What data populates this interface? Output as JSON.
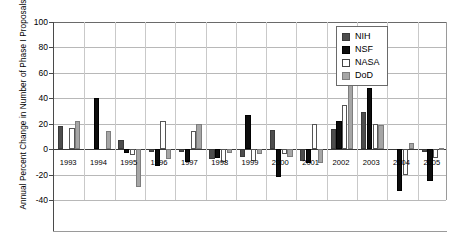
{
  "chart_data": {
    "type": "bar",
    "title": "",
    "ylabel": "Annual Percent Change in Number of Phase I Proposals",
    "xlabel": "",
    "ylim": [
      -40,
      100
    ],
    "yticks": [
      -40,
      -20,
      0,
      20,
      40,
      60,
      80,
      100
    ],
    "grid": true,
    "legend_position": "top-right",
    "categories": [
      "1993",
      "1994",
      "1995",
      "1996",
      "1997",
      "1998",
      "1999",
      "2000",
      "2001",
      "2002",
      "2003",
      "2004",
      "2005"
    ],
    "series": [
      {
        "name": "NIH",
        "color": "#4d4d4d",
        "values": [
          18,
          0,
          7,
          -2,
          -2,
          -8,
          -6,
          15,
          -9,
          16,
          29,
          0,
          -2
        ]
      },
      {
        "name": "NSF",
        "color": "#0d0d0d",
        "values": [
          0,
          40,
          -3,
          -13,
          -10,
          -7,
          27,
          -22,
          -11,
          22,
          48,
          -33,
          -25
        ]
      },
      {
        "name": "NASA",
        "color": "#ffffff",
        "values": [
          17,
          0,
          -5,
          22,
          14,
          -10,
          -9,
          -4,
          20,
          35,
          20,
          -20,
          -7
        ]
      },
      {
        "name": "DoD",
        "color": "#a6a6a6",
        "values": [
          22,
          14,
          -30,
          -8,
          20,
          -3,
          -4,
          -6,
          -11,
          77,
          19,
          5,
          1
        ]
      }
    ]
  },
  "legend": {
    "items": [
      {
        "label": "NIH",
        "swatch": "nih"
      },
      {
        "label": "NSF",
        "swatch": "nsf"
      },
      {
        "label": "NASA",
        "swatch": "nasa"
      },
      {
        "label": "DoD",
        "swatch": "dod"
      }
    ]
  }
}
